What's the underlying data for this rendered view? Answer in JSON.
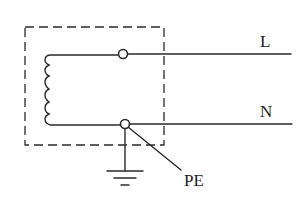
{
  "diagram": {
    "labels": {
      "line": "L",
      "neutral": "N",
      "protective_earth": "PE"
    },
    "components": [
      {
        "id": "enclosure",
        "type": "dashed-boundary"
      },
      {
        "id": "coil",
        "type": "inductor-winding",
        "turns": 5
      },
      {
        "id": "terminal-L",
        "type": "terminal"
      },
      {
        "id": "terminal-N",
        "type": "terminal"
      },
      {
        "id": "ground",
        "type": "earth-symbol"
      }
    ],
    "connections": [
      {
        "from": "coil-top",
        "to": "terminal-L"
      },
      {
        "from": "terminal-L",
        "to": "L"
      },
      {
        "from": "coil-bottom",
        "to": "terminal-N"
      },
      {
        "from": "terminal-N",
        "to": "N"
      },
      {
        "from": "terminal-N",
        "to": "ground"
      },
      {
        "from": "terminal-N",
        "to": "PE",
        "style": "leader-line"
      }
    ],
    "colors": {
      "ink": "#2a2a2a",
      "background": "#ffffff"
    }
  }
}
